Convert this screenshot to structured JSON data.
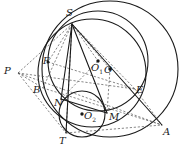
{
  "figure": {
    "type": "geometry-diagram",
    "width": 184,
    "height": 154,
    "background": "#ffffff",
    "stroke_solid": "#1a1a1a",
    "stroke_dashed": "#555555",
    "labels": {
      "S": "S",
      "P": "P",
      "A": "A",
      "E": "E",
      "B": "B",
      "N": "N",
      "T": "T",
      "M": "M",
      "F": "F",
      "O": "O",
      "O1": "O",
      "O1sub": "1",
      "O2": "O",
      "O2sub": "2"
    },
    "points": [
      {
        "name": "S",
        "x": 72,
        "y": 24
      },
      {
        "name": "P",
        "x": 18,
        "y": 73
      },
      {
        "name": "A",
        "x": 162,
        "y": 125
      },
      {
        "name": "E",
        "x": 135,
        "y": 89
      },
      {
        "name": "B",
        "x": 43,
        "y": 88
      },
      {
        "name": "N",
        "x": 61,
        "y": 99
      },
      {
        "name": "T",
        "x": 66,
        "y": 133
      },
      {
        "name": "M",
        "x": 107,
        "y": 113
      },
      {
        "name": "F",
        "x": 48,
        "y": 62
      },
      {
        "name": "O",
        "x": 110,
        "y": 69
      },
      {
        "name": "O1",
        "x": 98,
        "y": 61
      },
      {
        "name": "O2",
        "x": 82,
        "y": 114
      }
    ],
    "circles": [
      {
        "name": "big-circle-O",
        "cx": 110,
        "cy": 69,
        "r": 68,
        "stroke": "#1a1a1a"
      },
      {
        "name": "circle-O1",
        "cx": 98,
        "cy": 61,
        "r": 50,
        "stroke": "#1a1a1a"
      },
      {
        "name": "circle-O2",
        "cx": 82,
        "cy": 114,
        "r": 23,
        "stroke": "#1a1a1a"
      },
      {
        "name": "arc-circle-left",
        "cx": 92,
        "cy": 73,
        "r": 54,
        "stroke": "#1a1a1a"
      }
    ],
    "solid_segments": [
      {
        "name": "chord-SA",
        "from": "S",
        "to": "A"
      },
      {
        "name": "chord-ST",
        "from": "S",
        "to": "T"
      },
      {
        "name": "chord-SM",
        "from": "S",
        "to": "M"
      },
      {
        "name": "chord-SN",
        "from": "S",
        "to": "N"
      },
      {
        "name": "chord-NM",
        "from": "N",
        "to": "M"
      }
    ],
    "dashed_segments": [
      {
        "name": "seg-PS",
        "from": "P",
        "to": "S"
      },
      {
        "name": "seg-PB",
        "from": "P",
        "to": "B"
      },
      {
        "name": "seg-PT",
        "from": "P",
        "to": "T"
      },
      {
        "name": "seg-PA",
        "from": "P",
        "to": "A"
      },
      {
        "name": "seg-PE",
        "from": "P",
        "to": "E"
      },
      {
        "name": "seg-SB",
        "from": "S",
        "to": "B"
      },
      {
        "name": "seg-SE",
        "from": "S",
        "to": "E"
      },
      {
        "name": "seg-SO",
        "from": "S",
        "to": "O"
      },
      {
        "name": "seg-SO1",
        "from": "S",
        "to": "O1"
      },
      {
        "name": "seg-ST-vert",
        "from": "S",
        "to": "T"
      },
      {
        "name": "seg-BA",
        "from": "B",
        "to": "A"
      },
      {
        "name": "seg-TA",
        "from": "T",
        "to": "A"
      },
      {
        "name": "seg-EA",
        "from": "E",
        "to": "A"
      },
      {
        "name": "seg-OM",
        "from": "O",
        "to": "M"
      },
      {
        "name": "seg-O1N",
        "from": "O1",
        "to": "N"
      }
    ]
  }
}
